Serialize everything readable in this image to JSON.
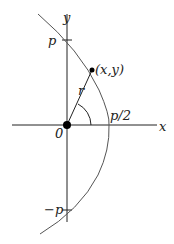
{
  "diagram": {
    "type": "parabola-polar-coordinates",
    "labels": {
      "x_axis": "x",
      "y_axis": "y",
      "origin": "0",
      "p_top": "p",
      "p_bottom": "−p",
      "vertex": "p/2",
      "point": "(x,y)",
      "radius": "r"
    },
    "colors": {
      "axes": "#222222",
      "curve": "#555555",
      "point": "#000000"
    }
  }
}
